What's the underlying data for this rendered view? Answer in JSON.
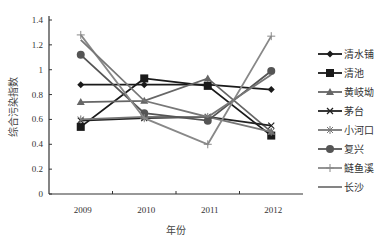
{
  "chart_data": {
    "type": "line",
    "title": "",
    "xlabel": "年份",
    "ylabel": "综合污染指数",
    "categories": [
      "2009",
      "2010",
      "2011",
      "2012"
    ],
    "ylim": [
      0,
      1.4
    ],
    "yticks": [
      "0",
      "0.2",
      "0.4",
      "0.6",
      "0.8",
      "1",
      "1.2",
      "1.4"
    ],
    "grid": false,
    "legend_position": "right",
    "series": [
      {
        "name": "清水铺",
        "marker": "diamond",
        "color": "#1a1a1a",
        "values": [
          0.88,
          0.88,
          0.88,
          0.84
        ]
      },
      {
        "name": "清池",
        "marker": "square",
        "color": "#1a1a1a",
        "values": [
          0.54,
          0.93,
          0.87,
          0.47
        ]
      },
      {
        "name": "黄岐坳",
        "marker": "triangle",
        "color": "#666666",
        "values": [
          0.74,
          0.75,
          0.93,
          0.5
        ]
      },
      {
        "name": "茅台",
        "marker": "x",
        "color": "#222222",
        "values": [
          0.59,
          0.61,
          0.62,
          0.55
        ]
      },
      {
        "name": "小河口",
        "marker": "asterisk",
        "color": "#777777",
        "values": [
          0.6,
          0.62,
          0.62,
          0.5
        ]
      },
      {
        "name": "复兴",
        "marker": "circle",
        "color": "#555555",
        "values": [
          1.12,
          0.65,
          0.59,
          0.99
        ]
      },
      {
        "name": "鲢鱼溪",
        "marker": "plus",
        "color": "#888888",
        "values": [
          1.28,
          0.61,
          0.4,
          1.27
        ]
      },
      {
        "name": "长沙",
        "marker": "none",
        "color": "#777777",
        "values": [
          1.24,
          0.75,
          0.62,
          0.96
        ]
      }
    ]
  }
}
